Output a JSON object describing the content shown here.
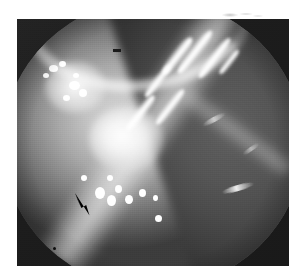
{
  "page": {
    "background_color": "#ffffff",
    "margin_mark": {
      "name": "faint-pencil-smudge",
      "description": "faint grey pencil smudge in the upper right page margin"
    }
  },
  "figure": {
    "type": "photograph",
    "modality": "endoscopic-grayscale-photograph",
    "frame": {
      "x": 17,
      "y": 19,
      "width": 272,
      "height": 247
    },
    "colors": {
      "surround": "#1c1c1c",
      "tissue_bright": "#d9d9d9",
      "tissue_mid": "#8a8a8a",
      "tissue_dark": "#4a4a4a",
      "specular_highlight": "#ffffff",
      "annotation": "#000000"
    },
    "regions": [
      {
        "name": "dark-barrel-surround",
        "description": "black square border around the circular endoscopic field of view"
      },
      {
        "name": "circular-field-of-view",
        "description": "round illuminated endoscopic field filling most of the frame"
      },
      {
        "name": "top-bright-arc",
        "description": "bright curved band arcing across the upper portion of the field"
      },
      {
        "name": "oblique-fold-ridge",
        "description": "broad bright oblique ridge running from upper right to lower left"
      },
      {
        "name": "right-dark-lobe",
        "description": "darker grey lobe occupying the right side of the field"
      },
      {
        "name": "central-light-pool",
        "description": "bright central highlight where the light source pools"
      },
      {
        "name": "specular-streak-cluster",
        "description": "four to seven bright parallel diagonal specular streaks in the upper right"
      },
      {
        "name": "bright-speck-cluster-left",
        "description": "cluster of small bright granular specks on the left of centre"
      },
      {
        "name": "bright-speck-cluster-lower",
        "description": "cluster of bright specks below and right of the arrow tip"
      },
      {
        "name": "dark-dash-artifact",
        "description": "small dark horizontal dash artefact in the upper centre"
      }
    ],
    "annotation": {
      "name": "arrow-marker",
      "shape": "solid-black-arrowhead",
      "points_toward": "upper-left",
      "position": {
        "x": 75,
        "y": 196
      },
      "color": "#000000"
    }
  }
}
